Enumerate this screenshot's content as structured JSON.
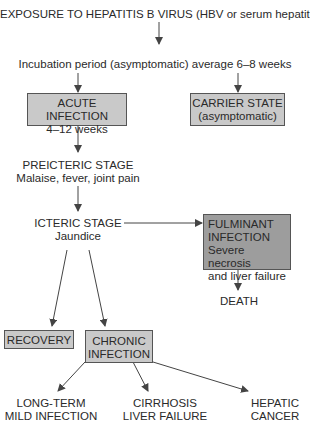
{
  "title": "EXPOSURE TO HEPATITIS B VIRUS (HBV or serum hepatitis)",
  "incubation": "Incubation period (asymptomatic) average 6–8 weeks",
  "acute": {
    "line1": "ACUTE INFECTION",
    "line2": "4–12 weeks"
  },
  "carrier": {
    "line1": "CARRIER STATE",
    "line2": "(asymptomatic)"
  },
  "preicteric": {
    "line1": "PREICTERIC STAGE",
    "line2": "Malaise, fever, joint pain"
  },
  "icteric": {
    "line1": "ICTERIC STAGE",
    "line2": "Jaundice"
  },
  "fulminant": {
    "line1": "FULMINANT",
    "line2": "INFECTION",
    "line3": "Severe necrosis",
    "line4": "and liver failure"
  },
  "death": "DEATH",
  "recovery": "RECOVERY",
  "chronic": {
    "line1": "CHRONIC",
    "line2": "INFECTION"
  },
  "outcomes": [
    {
      "line1": "LONG-TERM",
      "line2": "MILD INFECTION"
    },
    {
      "line1": "CIRRHOSIS",
      "line2": "LIVER FAILURE"
    },
    {
      "line1": "HEPATIC",
      "line2": "CANCER"
    }
  ],
  "colors": {
    "box_light": "#c9c9c9",
    "box_dark": "#9d9d9d",
    "line": "#444444"
  }
}
